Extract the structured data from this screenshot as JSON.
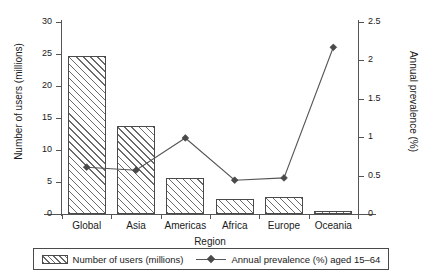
{
  "chart_data": {
    "type": "bar",
    "title": "",
    "subtitle": "",
    "xlabel": "Region",
    "ylabel": "Number of users (millions)",
    "y2label": "Annual prevalence (%)",
    "categories": [
      "Global",
      "Asia",
      "Americas",
      "Africa",
      "Europe",
      "Oceania"
    ],
    "grid": false,
    "legend_position": "bottom",
    "ylim": [
      0,
      30
    ],
    "y2lim": [
      0,
      2.5
    ],
    "yticks": [
      "0",
      "5",
      "10",
      "15",
      "20",
      "25",
      "30"
    ],
    "ytick_values": [
      0,
      5,
      10,
      15,
      20,
      25,
      30
    ],
    "y2ticks": [
      "0",
      "0.5",
      "1",
      "1.5",
      "2",
      "2.5"
    ],
    "y2tick_values": [
      0,
      0.5,
      1,
      1.5,
      2,
      2.5
    ],
    "series": [
      {
        "name": "Number of users (millions)",
        "type": "bar",
        "axis": "left",
        "values": [
          24.7,
          13.8,
          5.7,
          2.3,
          2.6,
          0.4
        ]
      },
      {
        "name": "Annual prevalence (%) aged 15–64",
        "type": "line",
        "axis": "right",
        "values": [
          0.61,
          0.57,
          0.99,
          0.44,
          0.47,
          2.17
        ]
      }
    ]
  },
  "legend": {
    "items": [
      {
        "label": "Number of users (millions)",
        "marker": "hatched-swatch"
      },
      {
        "label": "Annual prevalence (%) aged 15–64",
        "marker": "line-diamond"
      }
    ]
  }
}
